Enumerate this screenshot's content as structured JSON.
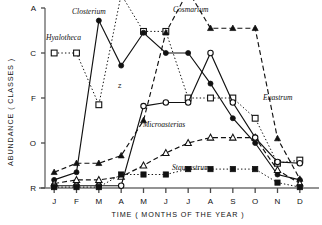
{
  "chart_data": {
    "type": "line",
    "title": "",
    "xlabel": "TIME ( MONTHS OF THE YEAR )",
    "ylabel": "ABUNDANCE ( CLASSES )",
    "x": [
      "J",
      "F",
      "M",
      "A",
      "M",
      "J",
      "J",
      "A",
      "S",
      "O",
      "N",
      "D"
    ],
    "categories": [
      "J",
      "F",
      "M",
      "A",
      "M",
      "J",
      "J",
      "A",
      "S",
      "O",
      "N",
      "D"
    ],
    "yticklabels": [
      "A",
      "C",
      "F",
      "O",
      "R"
    ],
    "ylim": [
      0,
      4
    ],
    "ytick_values": [
      4,
      3,
      2,
      1,
      0
    ],
    "grid": false,
    "legend": "inline-labels",
    "annotations": [
      {
        "text": "Z",
        "x": "M",
        "note": "marker near Hyalotheca dip"
      }
    ],
    "series": [
      {
        "name": "Closterium",
        "marker": "open-square",
        "line": "dotted",
        "label_x": "M",
        "values": [
          3.0,
          3.0,
          1.85,
          4.3,
          3.48,
          3.48,
          2.0,
          2.0,
          2.0,
          1.55,
          0.55,
          0.62
        ],
        "points": [
          {
            "x": "J",
            "y": 3.0
          },
          {
            "x": "F",
            "y": 3.0
          },
          {
            "x": "M",
            "y": 1.85
          },
          {
            "x": "A",
            "y": 4.3
          },
          {
            "x": "M",
            "y": 3.48
          },
          {
            "x": "J",
            "y": 3.48
          },
          {
            "x": "J",
            "y": 2.0
          },
          {
            "x": "A",
            "y": 2.0
          },
          {
            "x": "S",
            "y": 2.0
          },
          {
            "x": "O",
            "y": 1.55
          },
          {
            "x": "N",
            "y": 0.55
          },
          {
            "x": "D",
            "y": 0.62
          }
        ]
      },
      {
        "name": "Hyalotheca",
        "marker": "filled-circle",
        "line": "solid",
        "label_x": "F",
        "values": [
          0.18,
          0.35,
          3.72,
          2.72,
          3.45,
          3.0,
          3.0,
          2.32,
          1.55,
          1.0,
          0.3,
          0.18
        ],
        "points": [
          {
            "x": "J",
            "y": 0.18
          },
          {
            "x": "F",
            "y": 0.35
          },
          {
            "x": "M",
            "y": 3.72
          },
          {
            "x": "A",
            "y": 2.72
          },
          {
            "x": "M",
            "y": 3.45
          },
          {
            "x": "J",
            "y": 3.0
          },
          {
            "x": "J",
            "y": 3.0
          },
          {
            "x": "A",
            "y": 2.32
          },
          {
            "x": "S",
            "y": 1.55
          },
          {
            "x": "O",
            "y": 1.0
          },
          {
            "x": "N",
            "y": 0.3
          },
          {
            "x": "D",
            "y": 0.18
          }
        ]
      },
      {
        "name": "Cosmarium",
        "marker": "filled-triangle",
        "line": "dashed",
        "label_x": "J",
        "values": [
          0.35,
          0.55,
          0.55,
          0.72,
          1.5,
          3.45,
          4.38,
          3.55,
          3.55,
          3.55,
          1.1,
          0.2
        ],
        "points": [
          {
            "x": "J",
            "y": 0.35
          },
          {
            "x": "F",
            "y": 0.55
          },
          {
            "x": "M",
            "y": 0.55
          },
          {
            "x": "A",
            "y": 0.72
          },
          {
            "x": "M",
            "y": 1.5
          },
          {
            "x": "J",
            "y": 3.45
          },
          {
            "x": "J",
            "y": 4.38
          },
          {
            "x": "A",
            "y": 3.55
          },
          {
            "x": "S",
            "y": 3.55
          },
          {
            "x": "O",
            "y": 3.55
          },
          {
            "x": "N",
            "y": 1.1
          },
          {
            "x": "D",
            "y": 0.2
          }
        ]
      },
      {
        "name": "Microasterias",
        "marker": "open-triangle",
        "line": "dashed",
        "label_x": "A",
        "values": [
          0.1,
          0.18,
          0.18,
          0.25,
          0.5,
          0.78,
          1.0,
          1.12,
          1.12,
          1.12,
          0.4,
          0.1
        ],
        "points": [
          {
            "x": "J",
            "y": 0.1
          },
          {
            "x": "F",
            "y": 0.18
          },
          {
            "x": "M",
            "y": 0.18
          },
          {
            "x": "A",
            "y": 0.25
          },
          {
            "x": "M",
            "y": 0.5
          },
          {
            "x": "J",
            "y": 0.78
          },
          {
            "x": "J",
            "y": 1.0
          },
          {
            "x": "A",
            "y": 1.12
          },
          {
            "x": "S",
            "y": 1.12
          },
          {
            "x": "O",
            "y": 1.12
          },
          {
            "x": "N",
            "y": 0.4
          },
          {
            "x": "D",
            "y": 0.1
          }
        ]
      },
      {
        "name": "Euastrum",
        "marker": "open-circle",
        "line": "solid",
        "label_x": "O",
        "values": [
          0.05,
          0.05,
          0.05,
          0.05,
          1.82,
          1.9,
          1.9,
          3.0,
          1.9,
          1.12,
          0.58,
          0.55
        ],
        "points": [
          {
            "x": "J",
            "y": 0.05
          },
          {
            "x": "F",
            "y": 0.05
          },
          {
            "x": "M",
            "y": 0.05
          },
          {
            "x": "A",
            "y": 0.05
          },
          {
            "x": "M",
            "y": 1.82
          },
          {
            "x": "J",
            "y": 1.9
          },
          {
            "x": "J",
            "y": 1.9
          },
          {
            "x": "A",
            "y": 3.0
          },
          {
            "x": "S",
            "y": 1.9
          },
          {
            "x": "O",
            "y": 1.12
          },
          {
            "x": "N",
            "y": 0.58
          },
          {
            "x": "D",
            "y": 0.55
          }
        ]
      },
      {
        "name": "Staurastrum",
        "marker": "filled-square",
        "line": "dotted",
        "label_x": "S",
        "values": [
          0.02,
          0.02,
          0.02,
          0.3,
          0.3,
          0.3,
          0.42,
          0.42,
          0.42,
          0.42,
          0.12,
          0.02
        ],
        "points": [
          {
            "x": "J",
            "y": 0.02
          },
          {
            "x": "F",
            "y": 0.02
          },
          {
            "x": "M",
            "y": 0.02
          },
          {
            "x": "A",
            "y": 0.3
          },
          {
            "x": "M",
            "y": 0.3
          },
          {
            "x": "J",
            "y": 0.3
          },
          {
            "x": "J",
            "y": 0.42
          },
          {
            "x": "A",
            "y": 0.42
          },
          {
            "x": "S",
            "y": 0.42
          },
          {
            "x": "O",
            "y": 0.42
          },
          {
            "x": "N",
            "y": 0.12
          },
          {
            "x": "D",
            "y": 0.02
          }
        ]
      }
    ]
  },
  "labels": {
    "closterium": "Closterium",
    "hyalotheca": "Hyalotheca",
    "cosmarium": "Cosmarium",
    "microasterias": "Microasterias",
    "euastrum": "Euastrum",
    "staurastrum": "Staurastrum",
    "z_annotation": "Z"
  },
  "axes": {
    "x_title": "TIME ( MONTHS OF THE YEAR )",
    "y_title": "ABUNDANCE ( CLASSES )",
    "x_ticks": [
      "J",
      "F",
      "M",
      "A",
      "M",
      "J",
      "J",
      "A",
      "S",
      "O",
      "N",
      "D"
    ],
    "y_ticks": [
      "A",
      "C",
      "F",
      "O",
      "R"
    ]
  },
  "colors": {
    "ink": "#111111",
    "background": "#ffffff"
  }
}
